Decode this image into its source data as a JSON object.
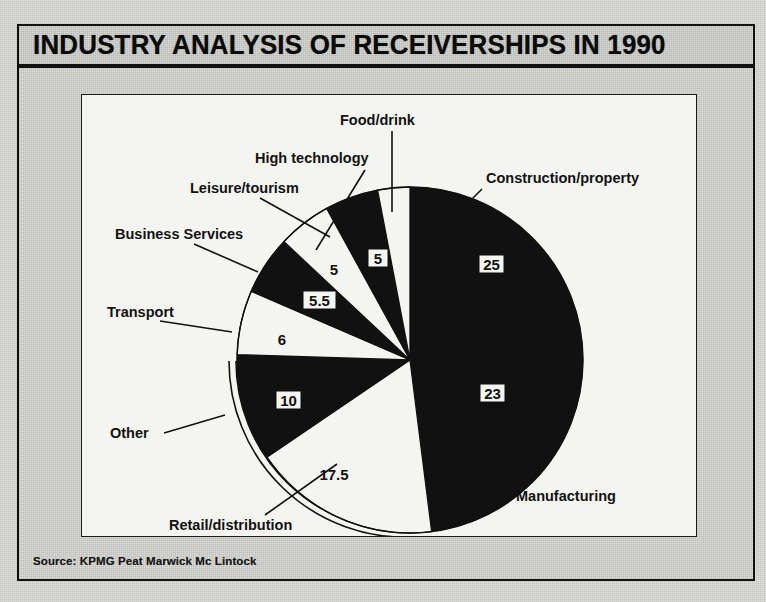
{
  "header": {
    "title": "INDUSTRY ANALYSIS OF RECEIVERSHIPS IN 1990"
  },
  "footer": {
    "source": "Source: KPMG Peat Marwick Mc Lintock"
  },
  "chart_data": {
    "type": "pie",
    "title": "INDUSTRY ANALYSIS OF RECEIVERSHIPS IN 1990",
    "subtitle": "",
    "xlabel": "",
    "ylabel": "",
    "units": "percent",
    "legend": "none",
    "grid": false,
    "start_angle_deg": 0,
    "direction": "clockwise",
    "total": 100,
    "categories": [
      "Construction/property",
      "Manufacturing",
      "Retail/distribution",
      "Other",
      "Transport",
      "Business Services",
      "Leisure/tourism",
      "High technology",
      "Food/drink"
    ],
    "values": [
      25,
      23,
      17.5,
      10,
      6,
      5.5,
      5,
      5,
      3
    ],
    "slices": [
      {
        "label": "Construction/property",
        "value": 25,
        "value_text": "25",
        "fill": "black",
        "value_style": "dark-on-white-box"
      },
      {
        "label": "Manufacturing",
        "value": 23,
        "value_text": "23",
        "fill": "black",
        "value_style": "dark-on-white-box"
      },
      {
        "label": "Retail/distribution",
        "value": 17.5,
        "value_text": "17.5",
        "fill": "white",
        "value_style": "dark-on-white"
      },
      {
        "label": "Other",
        "value": 10,
        "value_text": "10",
        "fill": "black",
        "value_style": "dark-on-white-box"
      },
      {
        "label": "Transport",
        "value": 6,
        "value_text": "6",
        "fill": "white",
        "value_style": "dark-on-white"
      },
      {
        "label": "Business Services",
        "value": 5.5,
        "value_text": "5.5",
        "fill": "black",
        "value_style": "dark-on-white-box"
      },
      {
        "label": "Leisure/tourism",
        "value": 5,
        "value_text": "5",
        "fill": "white",
        "value_style": "dark-on-white"
      },
      {
        "label": "High technology",
        "value": 5,
        "value_text": "5",
        "fill": "black",
        "value_style": "dark-on-white-box"
      },
      {
        "label": "Food/drink",
        "value": 3,
        "value_text": "3",
        "fill": "white",
        "value_style": "light-on-black"
      }
    ],
    "colors": {
      "dark": "#111111",
      "light": "#f4f4f0",
      "outline": "#111111"
    }
  },
  "labels": {
    "food_drink": "Food/drink",
    "high_technology": "High technology",
    "leisure_tourism": "Leisure/tourism",
    "business_services": "Business Services",
    "transport": "Transport",
    "other": "Other",
    "retail_distribution": "Retail/distribution",
    "manufacturing": "Manufacturing",
    "construction_property": "Construction/property"
  },
  "values": {
    "food_drink": "3",
    "high_technology": "5",
    "leisure_tourism": "5",
    "business_services": "5.5",
    "transport": "6",
    "other": "10",
    "retail_distribution": "17.5",
    "manufacturing": "23",
    "construction_property": "25"
  }
}
